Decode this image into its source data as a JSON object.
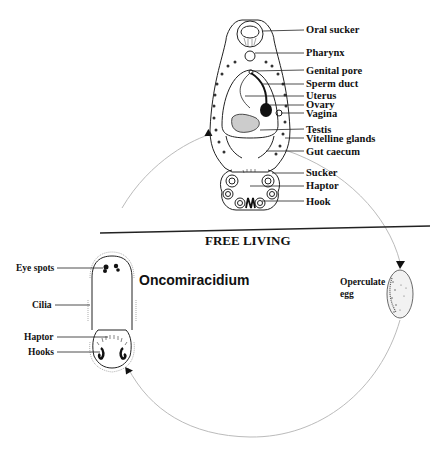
{
  "diagram": {
    "type": "life-cycle",
    "divider_label": "FREE LIVING",
    "adult": {
      "labels": [
        {
          "text": "Oral sucker",
          "x": 306,
          "y": 33
        },
        {
          "text": "Pharynx",
          "x": 306,
          "y": 56
        },
        {
          "text": "Genital pore",
          "x": 306,
          "y": 74
        },
        {
          "text": "Sperm duct",
          "x": 306,
          "y": 87
        },
        {
          "text": "Uterus",
          "x": 306,
          "y": 99
        },
        {
          "text": "Ovary",
          "x": 306,
          "y": 108
        },
        {
          "text": "Vagina",
          "x": 306,
          "y": 117
        },
        {
          "text": "Testis",
          "x": 306,
          "y": 133
        },
        {
          "text": "Vitelline glands",
          "x": 306,
          "y": 142
        },
        {
          "text": "Gut caecum",
          "x": 306,
          "y": 155
        },
        {
          "text": "Sucker",
          "x": 306,
          "y": 176
        },
        {
          "text": "Haptor",
          "x": 306,
          "y": 189
        },
        {
          "text": "Hook",
          "x": 306,
          "y": 205
        }
      ]
    },
    "larva": {
      "name": "Oncomiracidium",
      "labels": [
        {
          "text": "Eye spots",
          "x": 16,
          "y": 270
        },
        {
          "text": "Cilia",
          "x": 32,
          "y": 307
        },
        {
          "text": "Haptor",
          "x": 24,
          "y": 341
        },
        {
          "text": "Hooks",
          "x": 28,
          "y": 356
        }
      ]
    },
    "egg": {
      "label_line1": "Operculate",
      "label_line2": "egg"
    },
    "colors": {
      "ink": "#111111",
      "cycle_arrow": "#bbbbbb",
      "background": "#ffffff"
    }
  }
}
